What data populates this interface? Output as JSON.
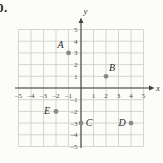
{
  "problem_number": "0.",
  "chart_data": {
    "type": "scatter",
    "title": "",
    "xlabel": "x",
    "ylabel": "y",
    "xlim": [
      -5,
      5
    ],
    "ylim": [
      -5,
      5
    ],
    "grid": true,
    "x_ticks": [
      -5,
      -4,
      -3,
      -2,
      -1,
      1,
      2,
      3,
      4,
      5
    ],
    "y_ticks": [
      5,
      4,
      3,
      2,
      1,
      -1,
      -2,
      -3,
      -4,
      -5
    ],
    "points": [
      {
        "label": "A",
        "x": -1,
        "y": 3,
        "label_dx": -8,
        "label_dy": -5
      },
      {
        "label": "B",
        "x": 2,
        "y": 1,
        "label_dx": 6,
        "label_dy": -5
      },
      {
        "label": "C",
        "x": 0,
        "y": -3,
        "label_dx": 8,
        "label_dy": 3
      },
      {
        "label": "D",
        "x": 4,
        "y": -3,
        "label_dx": -9,
        "label_dy": 3
      },
      {
        "label": "E",
        "x": -2,
        "y": -2,
        "label_dx": -9,
        "label_dy": 3
      }
    ],
    "colors": {
      "background": "#fcfcf9",
      "grid": "#cdd2ca",
      "axis": "#3f3f3f",
      "tick_text": "#4b4b4b",
      "point": "#878a87",
      "point_label": "#2a2a2a"
    }
  }
}
